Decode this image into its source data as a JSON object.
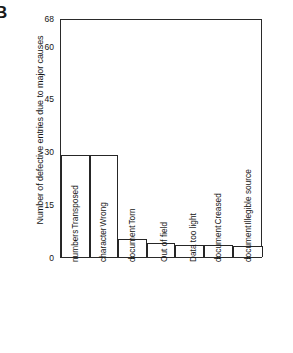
{
  "panel": {
    "letter": "B"
  },
  "chart_data": {
    "type": "bar",
    "title": "",
    "xlabel": "",
    "ylabel": "Number of defective entries due to major causes",
    "ylim": [
      0,
      68
    ],
    "yticks": [
      0,
      15,
      30,
      45,
      60,
      68
    ],
    "ytick_labels": [
      "0",
      "15",
      "30",
      "45",
      "60",
      "68"
    ],
    "grid": false,
    "legend": false,
    "categories": [
      "Transposed numbers",
      "Wrong character",
      "Torn document",
      "Out of field",
      "Data too light",
      "Creased document",
      "Illegible source document"
    ],
    "category_lines": [
      [
        "Transposed",
        "numbers"
      ],
      [
        "Wrong",
        "character"
      ],
      [
        "Torn",
        "document"
      ],
      [
        "Out of field"
      ],
      [
        "Data too light"
      ],
      [
        "Creased",
        "document"
      ],
      [
        "Illegible source",
        "document"
      ]
    ],
    "values": [
      29,
      29,
      5,
      4,
      3.5,
      3.5,
      3
    ],
    "bar_color": "#ffffff",
    "bar_edge_color": "#262626",
    "axis_color": "#2a2a2a"
  }
}
